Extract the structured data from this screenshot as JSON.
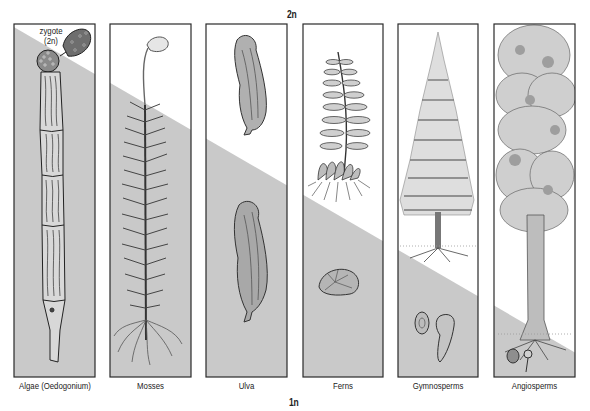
{
  "diagram": {
    "top_label": "2n",
    "bottom_label": "1n",
    "callout": {
      "line1": "zygote",
      "line2": "(2n)"
    },
    "colors": {
      "diploid_region": "#ffffff",
      "haploid_region": "#c9c9c9",
      "frame": "#2a2a2a",
      "ink": "#3a3a3a"
    },
    "panels": [
      {
        "label": "Algae (Oedogonium)",
        "organism": "oedogonium-filament"
      },
      {
        "label": "Mosses",
        "organism": "moss-gametophyte-with-sporophyte"
      },
      {
        "label": "Ulva",
        "organism": "ulva-sea-lettuce"
      },
      {
        "label": "Ferns",
        "organism": "fern-sporophyte-and-prothallus"
      },
      {
        "label": "Gymnosperms",
        "organism": "conifer-tree"
      },
      {
        "label": "Angiosperms",
        "organism": "flowering-tree"
      }
    ]
  }
}
